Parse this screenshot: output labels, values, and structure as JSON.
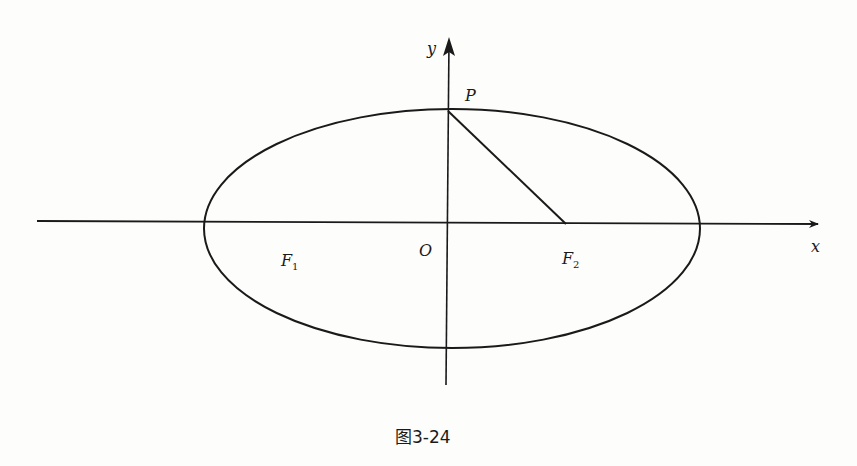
{
  "figure": {
    "caption": "图3-24",
    "axes": {
      "x_label": "x",
      "y_label": "y",
      "origin_label": "O"
    },
    "points": {
      "P": {
        "label": "P",
        "description": "top vertex of ellipse on y-axis"
      },
      "F1": {
        "label": "F",
        "subscript": "1",
        "description": "left focus"
      },
      "F2": {
        "label": "F",
        "subscript": "2",
        "description": "right focus"
      }
    },
    "shapes": {
      "ellipse": "horizontal ellipse centered at origin",
      "segment": "line segment from P to F2"
    },
    "colors": {
      "stroke": "#1a1a1a",
      "background": "#fdfdfb"
    }
  }
}
